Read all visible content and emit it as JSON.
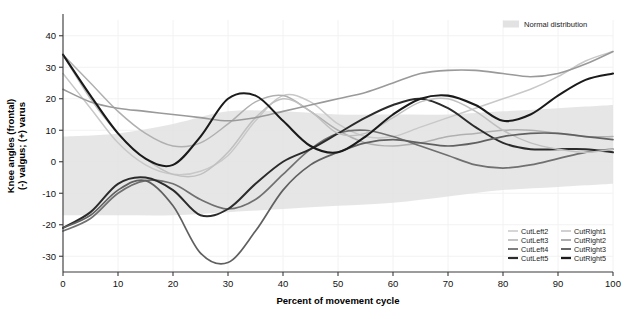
{
  "chart_data": {
    "type": "line",
    "title": "",
    "xlabel": "Percent of movement cycle",
    "ylabel": "Knee angles (frontal)\n(-) valgus; (+) varus",
    "ylabel_line1": "Knee angles (frontal)",
    "ylabel_line2": "(-) valgus; (+) varus",
    "xlim": [
      0,
      100
    ],
    "ylim": [
      -35,
      45
    ],
    "xticks": [
      0,
      10,
      20,
      30,
      40,
      50,
      60,
      70,
      80,
      90,
      100
    ],
    "yticks": [
      40,
      30,
      20,
      10,
      0,
      -10,
      -20,
      -30
    ],
    "grid": true,
    "legend_position": "bottom-right",
    "x": [
      0,
      5,
      10,
      15,
      20,
      25,
      30,
      35,
      40,
      45,
      50,
      55,
      60,
      65,
      70,
      75,
      80,
      85,
      90,
      95,
      100
    ],
    "series": [
      {
        "name": "CutLeft2",
        "color": "#c8c8c8",
        "width": 1.5,
        "values": [
          28,
          17,
          6,
          -1,
          -4,
          -3,
          2,
          13,
          21,
          19,
          12,
          8,
          8,
          11,
          14,
          17,
          20,
          23,
          27,
          32,
          35
        ]
      },
      {
        "name": "CutLeft3",
        "color": "#b0b0b0",
        "width": 1.5,
        "values": [
          34,
          25,
          16,
          9,
          5,
          6,
          12,
          19,
          21,
          16,
          10,
          6,
          5,
          6,
          8,
          9,
          10,
          10,
          9,
          8,
          8
        ]
      },
      {
        "name": "CutLeft4",
        "color": "#707070",
        "width": 1.7,
        "values": [
          -22,
          -18,
          -10,
          -6,
          -7,
          -12,
          -15,
          -12,
          -4,
          4,
          9,
          10,
          8,
          5,
          2,
          -1,
          -2,
          -1,
          1,
          3,
          4
        ]
      },
      {
        "name": "CutLeft5",
        "color": "#2b2b2b",
        "width": 2.0,
        "values": [
          -21,
          -16,
          -7,
          -5,
          -9,
          -17,
          -15,
          -7,
          0,
          4,
          9,
          14,
          18,
          20,
          17,
          11,
          6,
          4,
          4,
          4,
          3
        ]
      },
      {
        "name": "CutRight1",
        "color": "#c0c0c0",
        "width": 1.5,
        "values": [
          34,
          20,
          9,
          1,
          -4,
          -4,
          3,
          14,
          20,
          16,
          9,
          9,
          14,
          19,
          20,
          16,
          10,
          6,
          4,
          3,
          4
        ]
      },
      {
        "name": "CutRight2",
        "color": "#9a9a9a",
        "width": 1.6,
        "values": [
          23,
          19,
          17,
          16,
          15,
          14,
          13,
          14,
          16,
          18,
          20,
          22,
          25,
          28,
          29,
          29,
          28,
          27,
          28,
          31,
          35
        ]
      },
      {
        "name": "CutRight3",
        "color": "#606060",
        "width": 1.7,
        "values": [
          -21,
          -17,
          -9,
          -6,
          -14,
          -29,
          -32,
          -22,
          -9,
          -1,
          3,
          6,
          7,
          6,
          5,
          6,
          8,
          9,
          9,
          8,
          7
        ]
      },
      {
        "name": "CutRight5",
        "color": "#1a1a1a",
        "width": 2.1,
        "values": [
          34,
          21,
          9,
          1,
          -1,
          8,
          20,
          21,
          13,
          5,
          3,
          8,
          15,
          20,
          21,
          18,
          13,
          15,
          21,
          26,
          28
        ]
      }
    ],
    "band": {
      "label": "Normal distribution",
      "color": "#e2e2e2",
      "x": [
        0,
        10,
        20,
        30,
        40,
        50,
        60,
        70,
        80,
        90,
        100
      ],
      "upper": [
        8,
        9,
        12,
        16,
        16,
        15,
        15,
        15,
        16,
        17,
        18
      ],
      "lower": [
        -17,
        -17,
        -17,
        -16,
        -15,
        -14,
        -13,
        -11,
        -9,
        -8,
        -7
      ]
    },
    "legend_entries": [
      {
        "name": "CutLeft2",
        "color": "#c8c8c8",
        "width": 1.5
      },
      {
        "name": "CutLeft3",
        "color": "#b0b0b0",
        "width": 1.5
      },
      {
        "name": "CutLeft4",
        "color": "#707070",
        "width": 1.8
      },
      {
        "name": "CutLeft5",
        "color": "#2b2b2b",
        "width": 2.2
      },
      {
        "name": "CutRight1",
        "color": "#c0c0c0",
        "width": 1.5
      },
      {
        "name": "CutRight2",
        "color": "#9a9a9a",
        "width": 1.6
      },
      {
        "name": "CutRight3",
        "color": "#606060",
        "width": 1.9
      },
      {
        "name": "CutRight5",
        "color": "#1a1a1a",
        "width": 2.3
      }
    ]
  }
}
